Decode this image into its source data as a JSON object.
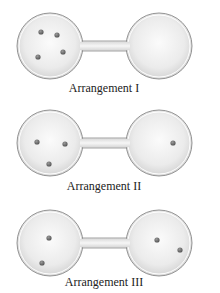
{
  "arrangements": [
    {
      "label": "Arrangement I",
      "left_bulb_molecules": 4,
      "right_bulb_molecules": 0
    },
    {
      "label": "Arrangement II",
      "left_bulb_molecules": 3,
      "right_bulb_molecules": 1
    },
    {
      "label": "Arrangement III",
      "left_bulb_molecules": 2,
      "right_bulb_molecules": 2
    }
  ],
  "colors": {
    "bulb_fill": "#e6e6e6",
    "bulb_outline": "#8a8a8a",
    "molecule": "#6f6f6f"
  }
}
